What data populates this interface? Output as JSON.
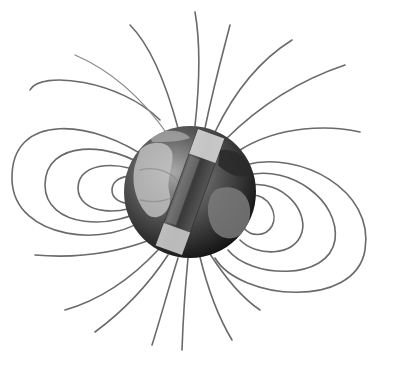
{
  "image": {
    "subject": "Earth magnetic field illustration",
    "description": "Globe with a tilted bar magnet inside and magnetic field lines looping around it",
    "colors": {
      "background": "#ffffff",
      "field_line": "#6a6a6a",
      "globe_dark": "#1e1e1e",
      "globe_light": "#9a9a9a",
      "magnet_light": "#d8d8d8",
      "magnet_dark": "#4a4a4a"
    }
  }
}
